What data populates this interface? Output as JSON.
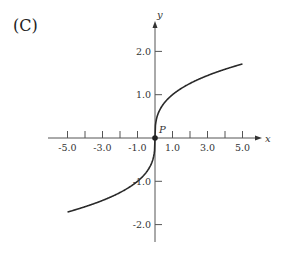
{
  "panel_label": "(C)",
  "chart_data": {
    "type": "line",
    "title": "",
    "xlabel": "x",
    "ylabel": "y",
    "function": "y = x^(1/3)",
    "xlim": [
      -5.6,
      6.0
    ],
    "ylim": [
      -2.4,
      2.7
    ],
    "grid": false,
    "x_ticks": [
      -5,
      -4,
      -3,
      -2,
      -1,
      1,
      2,
      3,
      4,
      5
    ],
    "x_tick_labels": [
      "-5.0",
      "-3.0",
      "-1.0",
      "1.0",
      "3.0",
      "5.0"
    ],
    "x_tick_label_values": [
      -5,
      -3,
      -1,
      1,
      3,
      5
    ],
    "y_ticks": [
      -2,
      -1,
      1,
      2
    ],
    "y_tick_labels": [
      "-2.0",
      "-1.0",
      "1.0",
      "2.0"
    ],
    "annotations": [
      {
        "text": "P",
        "x": 0,
        "y": 0
      }
    ],
    "series": [
      {
        "name": "curve",
        "x": [
          -5.0,
          -4.0,
          -3.0,
          -2.0,
          -1.0,
          -0.5,
          -0.1,
          0,
          0.1,
          0.5,
          1.0,
          2.0,
          3.0,
          4.0,
          5.0
        ],
        "y": [
          -1.71,
          -1.587,
          -1.442,
          -1.26,
          -1.0,
          -0.794,
          -0.464,
          0,
          0.464,
          0.794,
          1.0,
          1.26,
          1.442,
          1.587,
          1.71
        ]
      }
    ]
  }
}
